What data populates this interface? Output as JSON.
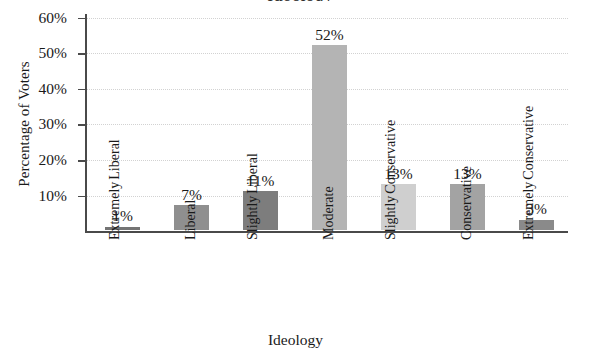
{
  "chart_data": {
    "type": "bar",
    "title": "Ideology",
    "title_cutoff_fragment": "Ideology",
    "xlabel": "Ideology",
    "ylabel": "Percentage of Voters",
    "categories": [
      "Extremely Liberal",
      "Liberal",
      "Slightly Liberal",
      "Moderate",
      "Slightly Conservative",
      "Conservative",
      "Extremely Conservative"
    ],
    "category_lines": [
      [
        "Extremely",
        "Liberal"
      ],
      [
        "Liberal"
      ],
      [
        "Slightly",
        "Liberal"
      ],
      [
        "Moderate"
      ],
      [
        "Slightly",
        "Conservative"
      ],
      [
        "Conservative"
      ],
      [
        "Extremely",
        "Conservative"
      ]
    ],
    "values": [
      1,
      7,
      11,
      52,
      13,
      13,
      3
    ],
    "value_labels": [
      "1%",
      "7%",
      "11%",
      "52%",
      "13%",
      "13%",
      "3%"
    ],
    "bar_colors": [
      "#747474",
      "#8f8f8f",
      "#7d7d7d",
      "#b4b4b4",
      "#cfcfcf",
      "#a3a3a3",
      "#8a8a8a"
    ],
    "ylim": [
      0,
      61
    ],
    "yticks": [
      10,
      20,
      30,
      40,
      50,
      60
    ],
    "ytick_labels": [
      "10%",
      "20%",
      "30%",
      "40%",
      "50%",
      "60%"
    ],
    "grid": true,
    "grid_color": "#d2d2d2",
    "legend": null,
    "axis_color": "#4a4a4a",
    "background": "#ffffff"
  }
}
